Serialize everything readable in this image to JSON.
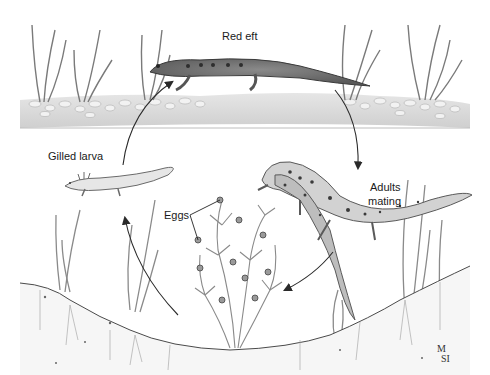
{
  "figure": {
    "background_color": "#ffffff",
    "ink_color": "#2a2a2a",
    "bank_color": "#d9d9d9",
    "water_color": "#f4f4f4",
    "soil_color": "#eeeeee"
  },
  "labels": {
    "red_eft": "Red eft",
    "gilled_larva": "Gilled larva",
    "adults_mating_line1": "Adults",
    "adults_mating_line2": "mating",
    "eggs": "Eggs"
  },
  "signature": {
    "line1": "M",
    "line2": "SI"
  },
  "cycle_order": [
    "Red eft",
    "Adults mating",
    "Eggs",
    "Gilled larva"
  ]
}
